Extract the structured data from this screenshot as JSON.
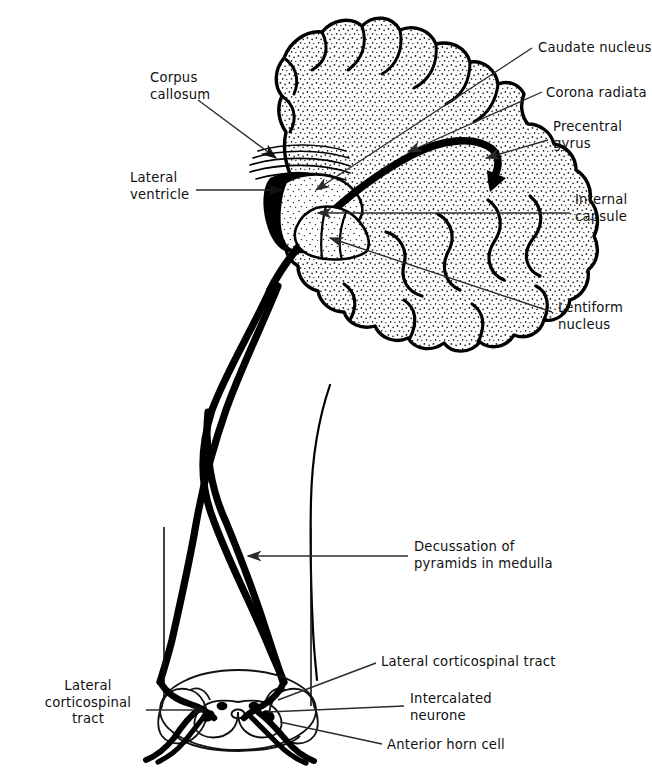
{
  "figure": {
    "type": "anatomical-diagram",
    "ink_color": "#000000",
    "background_color": "#ffffff",
    "leader_line_color": "#3a3a3a"
  },
  "labels": {
    "corpus_callosum": "Corpus\ncallosum",
    "lateral_ventricle": "Lateral\nventricle",
    "caudate_nucleus": "Caudate nucleus",
    "corona_radiata": "Corona radiata",
    "precentral_gyrus": "Precentral\ngyrus",
    "internal_capsule": "Internal\ncapsule",
    "lentiform_nucleus": "Lentiform\nnucleus",
    "decussation": "Decussation of\npyramids in medulla",
    "lateral_corticospinal_tract_right": "Lateral corticospinal tract",
    "intercalated_neurone": "Intercalated\nneurone",
    "anterior_horn_cell": "Anterior horn cell",
    "lateral_corticospinal_tract_left": "Lateral\ncorticospinal\ntract"
  },
  "label_positions": {
    "corpus_callosum": {
      "x": 150,
      "y": 78,
      "align": "left"
    },
    "lateral_ventricle": {
      "x": 130,
      "y": 178,
      "align": "left"
    },
    "caudate_nucleus": {
      "x": 538,
      "y": 40,
      "align": "left"
    },
    "corona_radiata": {
      "x": 548,
      "y": 86,
      "align": "left"
    },
    "precentral_gyrus": {
      "x": 553,
      "y": 120,
      "align": "left"
    },
    "internal_capsule": {
      "x": 575,
      "y": 193,
      "align": "left"
    },
    "lentiform_nucleus": {
      "x": 558,
      "y": 303,
      "align": "left"
    },
    "decussation": {
      "x": 414,
      "y": 540,
      "align": "left"
    },
    "lateral_corticospinal_tract_right": {
      "x": 381,
      "y": 659,
      "align": "left"
    },
    "intercalated_neurone": {
      "x": 410,
      "y": 696,
      "align": "left"
    },
    "anterior_horn_cell": {
      "x": 387,
      "y": 742,
      "align": "left"
    },
    "lateral_corticospinal_tract_left": {
      "x": 88,
      "y": 684,
      "align": "center"
    }
  },
  "structures": [
    {
      "name": "cerebral-hemisphere",
      "note": "stippled gyral outline, upper right of frame"
    },
    {
      "name": "corpus-callosum",
      "note": "set of fine curved striations below cortex"
    },
    {
      "name": "lateral-ventricle",
      "note": "solid black crescent"
    },
    {
      "name": "caudate-nucleus",
      "note": "stippled mass adjacent to ventricle"
    },
    {
      "name": "lentiform-nucleus",
      "note": "stippled wedge below internal capsule"
    },
    {
      "name": "internal-capsule",
      "note": "thick black band between caudate and lentiform nuclei"
    },
    {
      "name": "corona-radiata",
      "note": "fan of fibres converging on internal capsule"
    },
    {
      "name": "precentral-gyrus",
      "note": "motor cortex, origin of thick tract, arrowhead"
    },
    {
      "name": "pyramidal-decussation",
      "note": "X crossing of the two thick tracts in the medulla"
    },
    {
      "name": "spinal-cord-cross-section",
      "note": "butterfly grey matter with anterior horns"
    },
    {
      "name": "anterior-horn-cell",
      "note": "motor neurone in ventral horn with emerging root"
    },
    {
      "name": "intercalated-neurone",
      "note": "short interneurone in grey matter"
    }
  ]
}
